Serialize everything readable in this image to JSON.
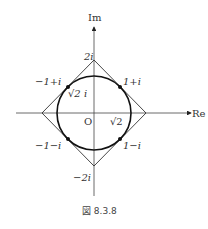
{
  "figure": {
    "caption": "図 8.3.8",
    "axes": {
      "x_label": "Re",
      "y_label": "Im",
      "origin_label": "O"
    },
    "square_vertices": {
      "top": "2i",
      "bottom": "−2i"
    },
    "points": [
      {
        "label": "−1+i",
        "value": "-1+i"
      },
      {
        "label": "1+i",
        "value": "1+i"
      },
      {
        "label": "−1−i",
        "value": "-1-i"
      },
      {
        "label": "1−i",
        "value": "1-i"
      }
    ],
    "radius_labels": {
      "real": "√2",
      "imag": "√2 i"
    },
    "colors": {
      "stroke": "#222222",
      "text": "#333333"
    }
  }
}
